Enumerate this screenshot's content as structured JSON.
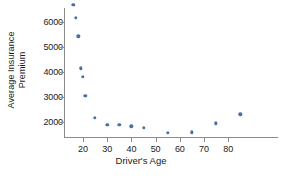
{
  "chart_data": {
    "type": "scatter",
    "title": "",
    "xlabel": "Driver's Age",
    "ylabel": "Average Insurance Premium",
    "ylabel_lines": [
      "Average Insurance",
      "Premium"
    ],
    "xlim": [
      14,
      88
    ],
    "ylim": [
      1400,
      6900
    ],
    "grid": false,
    "legend": null,
    "xticks": [
      20,
      30,
      40,
      50,
      60,
      70,
      80
    ],
    "yticks": [
      2000,
      3000,
      4000,
      5000,
      6000
    ],
    "xtick_labels": [
      "20",
      "30",
      "40",
      "50",
      "60",
      "70",
      "80"
    ],
    "ytick_labels": [
      "2000",
      "3000",
      "4000",
      "5000",
      "6000"
    ],
    "series_name": "Average insurance premium by driver's age",
    "point_color": "#4472a8",
    "axis_color": "#8c8c8c",
    "x": [
      16,
      17,
      18,
      19,
      20,
      21,
      25,
      30,
      35,
      40,
      45,
      55,
      65,
      75,
      85
    ],
    "y": [
      6700,
      6170,
      5430,
      4150,
      3800,
      3050,
      2170,
      1900,
      1880,
      1830,
      1770,
      1560,
      1590,
      1950,
      2310
    ],
    "points": [
      {
        "x": 16,
        "y": 6700
      },
      {
        "x": 17,
        "y": 6170
      },
      {
        "x": 18,
        "y": 5430
      },
      {
        "x": 19,
        "y": 4150
      },
      {
        "x": 20,
        "y": 3800
      },
      {
        "x": 21,
        "y": 3050
      },
      {
        "x": 25,
        "y": 2170
      },
      {
        "x": 30,
        "y": 1900
      },
      {
        "x": 35,
        "y": 1880
      },
      {
        "x": 40,
        "y": 1830
      },
      {
        "x": 45,
        "y": 1770
      },
      {
        "x": 55,
        "y": 1560
      },
      {
        "x": 65,
        "y": 1590
      },
      {
        "x": 75,
        "y": 1950
      },
      {
        "x": 85,
        "y": 2310
      }
    ]
  }
}
